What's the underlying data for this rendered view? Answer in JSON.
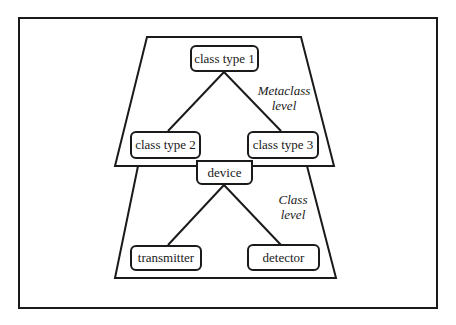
{
  "diagram": {
    "type": "hierarchy",
    "levels": [
      {
        "id": "metaclass",
        "label_line1": "Metaclass",
        "label_line2": "level",
        "nodes": [
          {
            "id": "ct1",
            "label": "class type 1"
          },
          {
            "id": "ct2",
            "label": "class type 2"
          },
          {
            "id": "ct3",
            "label": "class type 3"
          }
        ],
        "edges": [
          [
            "ct1",
            "ct2"
          ],
          [
            "ct1",
            "ct3"
          ]
        ]
      },
      {
        "id": "class",
        "label_line1": "Class",
        "label_line2": "level",
        "nodes": [
          {
            "id": "device",
            "label": "device"
          },
          {
            "id": "transmitter",
            "label": "transmitter"
          },
          {
            "id": "detector",
            "label": "detector"
          }
        ],
        "edges": [
          [
            "device",
            "transmitter"
          ],
          [
            "device",
            "detector"
          ]
        ]
      }
    ],
    "colors": {
      "stroke": "#1a1a1a",
      "background": "#ffffff"
    }
  }
}
